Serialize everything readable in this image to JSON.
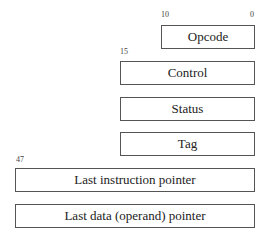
{
  "diagram": {
    "opcode": {
      "label": "Opcode",
      "bit_high": "10",
      "bit_low": "0"
    },
    "control": {
      "label": "Control",
      "bit_high": "15"
    },
    "status": {
      "label": "Status"
    },
    "tag": {
      "label": "Tag"
    },
    "last_instruction": {
      "label": "Last instruction pointer",
      "bit_high": "47"
    },
    "last_data": {
      "label": "Last data (operand) pointer"
    }
  }
}
